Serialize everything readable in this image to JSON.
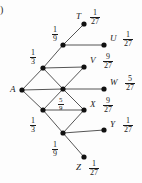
{
  "figure": {
    "paren_marker": ")",
    "type": "probability-lattice-diagram",
    "root_label": "A",
    "colors": {
      "node": "#111111",
      "edge": "#555555",
      "text": "#1a1a1a",
      "background": "#fdfdfd"
    },
    "nodes": [
      {
        "id": "A",
        "label": "A",
        "x": 22,
        "y": 90,
        "kind": "root"
      },
      {
        "id": "n1",
        "label": "",
        "x": 43,
        "y": 68,
        "kind": "internal"
      },
      {
        "id": "n2",
        "label": "",
        "x": 43,
        "y": 110,
        "kind": "internal"
      },
      {
        "id": "n3",
        "label": "",
        "x": 63,
        "y": 45,
        "kind": "internal"
      },
      {
        "id": "n4",
        "label": "",
        "x": 63,
        "y": 89,
        "kind": "internal"
      },
      {
        "id": "n5",
        "label": "",
        "x": 63,
        "y": 133,
        "kind": "internal"
      },
      {
        "id": "T",
        "label": "T",
        "x": 84,
        "y": 24,
        "kind": "leaf"
      },
      {
        "id": "U",
        "label": "U",
        "x": 104,
        "y": 45,
        "kind": "leaf"
      },
      {
        "id": "V",
        "label": "V",
        "x": 84,
        "y": 67,
        "kind": "leaf"
      },
      {
        "id": "W",
        "label": "W",
        "x": 104,
        "y": 89,
        "kind": "leaf"
      },
      {
        "id": "X",
        "label": "X",
        "x": 84,
        "y": 110,
        "kind": "leaf"
      },
      {
        "id": "Y",
        "label": "Y",
        "x": 104,
        "y": 130,
        "kind": "leaf"
      },
      {
        "id": "Z",
        "label": "Z",
        "x": 84,
        "y": 157,
        "kind": "leaf"
      }
    ],
    "edges": [
      {
        "from": "A",
        "to": "n1"
      },
      {
        "from": "A",
        "to": "n2"
      },
      {
        "from": "A",
        "to": "n4"
      },
      {
        "from": "n1",
        "to": "n3"
      },
      {
        "from": "n1",
        "to": "n4"
      },
      {
        "from": "n1",
        "to": "V"
      },
      {
        "from": "n2",
        "to": "n4"
      },
      {
        "from": "n2",
        "to": "n5"
      },
      {
        "from": "n2",
        "to": "X"
      },
      {
        "from": "n3",
        "to": "T"
      },
      {
        "from": "n3",
        "to": "U"
      },
      {
        "from": "n4",
        "to": "V"
      },
      {
        "from": "n4",
        "to": "W"
      },
      {
        "from": "n4",
        "to": "X"
      },
      {
        "from": "n5",
        "to": "X"
      },
      {
        "from": "n5",
        "to": "Y"
      },
      {
        "from": "n5",
        "to": "Z"
      }
    ],
    "edge_labels": [
      {
        "id": "p-1-9-top",
        "num": "1",
        "den": "9",
        "x": 52,
        "y": 25
      },
      {
        "id": "p-1-3-top",
        "num": "1",
        "den": "3",
        "x": 30,
        "y": 48
      },
      {
        "id": "p-5-9-center",
        "num": "5",
        "den": "9",
        "x": 58,
        "y": 95
      },
      {
        "id": "p-1-3-bottom",
        "num": "1",
        "den": "3",
        "x": 30,
        "y": 116
      },
      {
        "id": "p-1-9-bottom",
        "num": "1",
        "den": "9",
        "x": 52,
        "y": 140
      }
    ],
    "outcomes": [
      {
        "node": "T",
        "name": "T",
        "num": "1",
        "den": "27",
        "name_x": 76,
        "name_y": 12,
        "frac_x": 90,
        "frac_y": 8
      },
      {
        "node": "U",
        "name": "U",
        "num": "1",
        "den": "27",
        "name_x": 110,
        "name_y": 34,
        "frac_x": 123,
        "frac_y": 30
      },
      {
        "node": "V",
        "name": "V",
        "num": "9",
        "den": "27",
        "name_x": 90,
        "name_y": 56,
        "frac_x": 103,
        "frac_y": 52
      },
      {
        "node": "W",
        "name": "W",
        "num": "5",
        "den": "27",
        "name_x": 110,
        "name_y": 78,
        "frac_x": 125,
        "frac_y": 74
      },
      {
        "node": "X",
        "name": "X",
        "num": "9",
        "den": "27",
        "name_x": 90,
        "name_y": 100,
        "frac_x": 103,
        "frac_y": 96
      },
      {
        "node": "Y",
        "name": "Y",
        "num": "1",
        "den": "27",
        "name_x": 110,
        "name_y": 120,
        "frac_x": 123,
        "frac_y": 116
      },
      {
        "node": "Z",
        "name": "Z",
        "num": "1",
        "den": "27",
        "name_x": 76,
        "name_y": 163,
        "frac_x": 89,
        "frac_y": 159
      }
    ]
  }
}
